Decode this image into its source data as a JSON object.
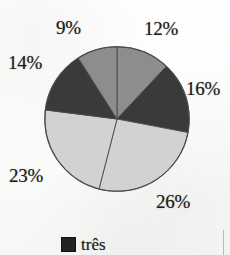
{
  "chart_data": {
    "type": "pie",
    "title": "",
    "labels": [
      "12%",
      "16%",
      "26%",
      "23%",
      "14%",
      "9%"
    ],
    "categories": [
      "um",
      "dois",
      "três",
      "quatro",
      "cinco",
      "seis"
    ],
    "values": [
      12,
      16,
      26,
      23,
      14,
      9
    ],
    "unit": "%",
    "total": 100,
    "start_angle_deg": 0,
    "direction": "clockwise",
    "slice_colors": [
      "#8d8d8d",
      "#3a3a3a",
      "#d2d2d2",
      "#d2d2d2",
      "#3a3a3a",
      "#8d8d8d"
    ],
    "outline_color": "#4a4a4a",
    "legend_position": "bottom",
    "legend": [
      {
        "label": "três",
        "color": "#232323"
      }
    ],
    "slices": [
      {
        "label": "12%",
        "value": 12,
        "color": "#8d8d8d",
        "tone": "medium-gray"
      },
      {
        "label": "16%",
        "value": 16,
        "color": "#3a3a3a",
        "tone": "dark-gray"
      },
      {
        "label": "26%",
        "value": 26,
        "color": "#d2d2d2",
        "tone": "light-gray"
      },
      {
        "label": "23%",
        "value": 23,
        "color": "#d2d2d2",
        "tone": "light-gray"
      },
      {
        "label": "14%",
        "value": 14,
        "color": "#3a3a3a",
        "tone": "dark-gray"
      },
      {
        "label": "9%",
        "value": 9,
        "color": "#8d8d8d",
        "tone": "medium-gray"
      }
    ]
  },
  "labels": {
    "nine": "9%",
    "twelve": "12%",
    "fourteen": "14%",
    "sixteen": "16%",
    "twentythree": "23%",
    "twentysix": "26%"
  },
  "legend": {
    "entries": [
      {
        "label": "três"
      }
    ]
  },
  "colors": {
    "light_gray": "#d2d2d2",
    "medium_gray": "#8d8d8d",
    "dark_gray": "#3a3a3a",
    "legend_swatch": "#232323",
    "outline": "#4a4a4a",
    "background": "#fdfdfc"
  }
}
